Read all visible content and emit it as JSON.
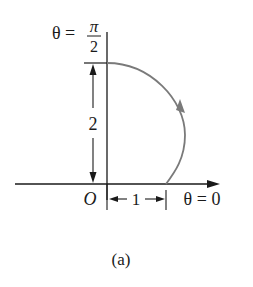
{
  "figure": {
    "caption": "(a)",
    "labels": {
      "theta_top_lhs": "θ =",
      "pi": "π",
      "two_denominator": "2",
      "origin": "O",
      "theta_zero": "θ = 0",
      "radius_vertical": "2",
      "radius_horizontal": "1"
    },
    "colors": {
      "axis": "#1a1a1a",
      "curve": "#7a7a7a",
      "text": "#1a1a1a"
    },
    "curve": {
      "description": "polar curve from θ=0 (r=1) to θ=π/2 (r=2)",
      "start": {
        "theta": "0",
        "r": 1
      },
      "end": {
        "theta": "π/2",
        "r": 2
      },
      "direction": "counterclockwise"
    }
  }
}
